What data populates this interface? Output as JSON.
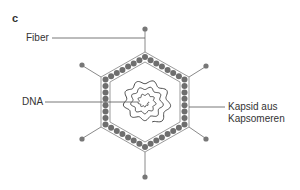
{
  "panel": {
    "letter": "c"
  },
  "labels": {
    "fiber": "Fiber",
    "dna": "DNA",
    "capsid_line1": "Kapsid aus",
    "capsid_line2": "Kapsomeren"
  },
  "colors": {
    "outline": "#9a9a9a",
    "capsomer": "#6e6e6e",
    "dna": "#3a3a3a",
    "leader": "#555555",
    "text": "#333333"
  }
}
